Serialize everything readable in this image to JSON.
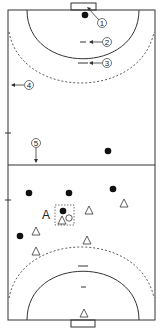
{
  "diagram": {
    "type": "handball-court",
    "court": {
      "x": 8,
      "y": 10,
      "width": 147,
      "height": 310,
      "center_y": 165
    },
    "goals": [
      {
        "name": "top-goal",
        "x": 71,
        "y": 3,
        "w": 25,
        "h": 7
      },
      {
        "name": "bottom-goal",
        "x": 71,
        "y": 320,
        "w": 24,
        "h": 7
      }
    ],
    "callouts": [
      {
        "id": "1",
        "label": "①",
        "x": 102,
        "y": 23
      },
      {
        "id": "2",
        "label": "②",
        "x": 107,
        "y": 42
      },
      {
        "id": "3",
        "label": "③",
        "x": 107,
        "y": 63
      },
      {
        "id": "4",
        "label": "④",
        "x": 29,
        "y": 85
      },
      {
        "id": "5",
        "label": "⑤",
        "x": 36,
        "y": 143
      }
    ],
    "players_attack": [
      {
        "x": 85,
        "y": 15
      },
      {
        "x": 108,
        "y": 151
      },
      {
        "x": 29,
        "y": 193
      },
      {
        "x": 69,
        "y": 193
      },
      {
        "x": 113,
        "y": 189
      },
      {
        "x": 63,
        "y": 211
      },
      {
        "x": 20,
        "y": 236
      }
    ],
    "players_defense": [
      {
        "x": 124,
        "y": 204
      },
      {
        "x": 89,
        "y": 211
      },
      {
        "x": 62,
        "y": 221
      },
      {
        "x": 36,
        "y": 232
      },
      {
        "x": 87,
        "y": 241
      },
      {
        "x": 36,
        "y": 252
      },
      {
        "x": 84,
        "y": 314
      }
    ],
    "ball": {
      "x": 69,
      "y": 216
    },
    "group_box": {
      "label": "A",
      "x": 55,
      "y": 205,
      "w": 19,
      "h": 20,
      "label_x": 46,
      "label_y": 219
    }
  }
}
